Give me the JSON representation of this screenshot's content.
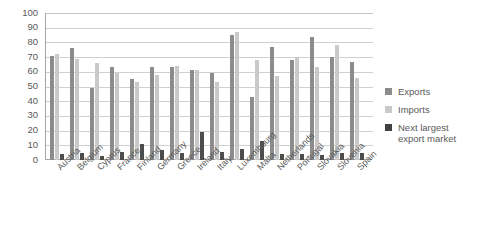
{
  "chart_data": {
    "type": "bar",
    "title": "",
    "subtitle": "",
    "xlabel": "",
    "ylabel": "",
    "ylim": [
      0,
      100
    ],
    "ytick_step": 10,
    "yticks": [
      "100",
      "90",
      "80",
      "70",
      "60",
      "50",
      "40",
      "30",
      "20",
      "10",
      "0"
    ],
    "grid": "horizontal",
    "legend_position": "right",
    "categories": [
      "Austria",
      "Belgium",
      "Cyprus",
      "France",
      "Finland",
      "Germany",
      "Greece",
      "Ireland",
      "Italy",
      "Luxembourg",
      "Malta",
      "Netherlands",
      "Portugal",
      "Slovakia",
      "Slovenia",
      "Spain"
    ],
    "series": [
      {
        "name": "Exports",
        "color": "#8c8c8c",
        "values": [
          71,
          76,
          49,
          63,
          55,
          63,
          63,
          61,
          59,
          85,
          43,
          77,
          68,
          84,
          70,
          67
        ]
      },
      {
        "name": "Imports",
        "color": "#c9c9c9",
        "values": [
          72,
          69,
          66,
          59,
          53,
          58,
          64,
          61,
          53,
          87,
          68,
          57,
          70,
          63,
          78,
          56
        ]
      },
      {
        "name": "Next largest\nexport market",
        "color": "#4d4d4d",
        "values": [
          4,
          4.5,
          3,
          5.5,
          11,
          7,
          4.5,
          19,
          5.5,
          7.5,
          13,
          4,
          4,
          3.5,
          5,
          4.5
        ]
      }
    ]
  },
  "legend": {
    "items": [
      {
        "label": "Exports"
      },
      {
        "label": "Imports"
      },
      {
        "label": "Next largest\nexport market"
      }
    ]
  }
}
